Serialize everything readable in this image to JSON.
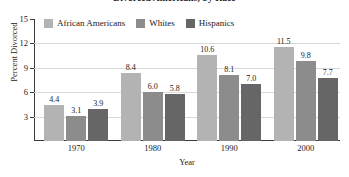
{
  "chart_data": {
    "type": "bar",
    "title": "Divorced Americans, by Race",
    "xlabel": "Year",
    "ylabel": "Percent Divorced",
    "categories": [
      "1970",
      "1980",
      "1990",
      "2000"
    ],
    "series": [
      {
        "name": "African Americans",
        "color": "#b3b3b3",
        "values": [
          4.4,
          8.4,
          10.6,
          11.5
        ]
      },
      {
        "name": "Whites",
        "color": "#8c8c8c",
        "values": [
          3.1,
          6.0,
          8.1,
          9.8
        ]
      },
      {
        "name": "Hispanics",
        "color": "#666666",
        "values": [
          3.9,
          5.8,
          7.0,
          7.7
        ]
      }
    ],
    "value_labels": [
      [
        "4.4",
        "3.1",
        "3.9"
      ],
      [
        "8.4",
        "6.0",
        "5.8"
      ],
      [
        "10.6",
        "8.1",
        "7.0"
      ],
      [
        "11.5",
        "9.8",
        "7.7"
      ]
    ],
    "ylim": [
      0,
      15
    ],
    "yticks": [
      3,
      6,
      9,
      12,
      15
    ],
    "ytick_labels": [
      "3",
      "6",
      "9",
      "12",
      "15"
    ],
    "grid": true,
    "legend_position": "top-left-inside"
  }
}
